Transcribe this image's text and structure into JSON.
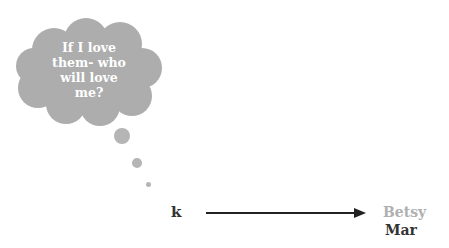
{
  "thought_bubble": {
    "lines": [
      "If I love",
      "them- who",
      "will love",
      "me?"
    ],
    "fill_color": "#adadad",
    "text_color": "#ffffff"
  },
  "relation": {
    "source_label": "k",
    "target_labels": [
      "Betsy",
      "Mar"
    ],
    "target_colors": [
      "#b0b0b0",
      "#333333"
    ],
    "arrow_color": "#222222"
  }
}
